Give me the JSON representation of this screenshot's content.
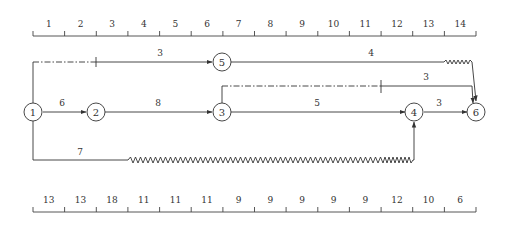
{
  "diagram": {
    "type": "time-scaled network (double-code) diagram",
    "top_scale": {
      "labels": [
        "1",
        "2",
        "3",
        "4",
        "5",
        "6",
        "7",
        "8",
        "9",
        "10",
        "11",
        "12",
        "13",
        "14"
      ]
    },
    "bottom_scale": {
      "labels": [
        "13",
        "13",
        "18",
        "11",
        "11",
        "11",
        "9",
        "9",
        "9",
        "9",
        "9",
        "12",
        "10",
        "6"
      ]
    },
    "nodes": [
      {
        "id": "1",
        "label": "1"
      },
      {
        "id": "2",
        "label": "2"
      },
      {
        "id": "3",
        "label": "3"
      },
      {
        "id": "4",
        "label": "4"
      },
      {
        "id": "5",
        "label": "5"
      },
      {
        "id": "6",
        "label": "6"
      }
    ],
    "activities": [
      {
        "from": "1",
        "to": "5",
        "label": "3",
        "note": "starts after dash-dot free float to day 2"
      },
      {
        "from": "5",
        "to": "6",
        "label": "4",
        "note": "wavy free-float at end"
      },
      {
        "from": "3",
        "to": "6",
        "label": "3",
        "note": "dash-dot lag then solid"
      },
      {
        "from": "1",
        "to": "2",
        "label": "6"
      },
      {
        "from": "2",
        "to": "3",
        "label": "8"
      },
      {
        "from": "3",
        "to": "4",
        "label": "5"
      },
      {
        "from": "4",
        "to": "6",
        "label": "3"
      },
      {
        "from": "1",
        "to": "4",
        "label": "7",
        "note": "long wavy free-float"
      }
    ]
  }
}
